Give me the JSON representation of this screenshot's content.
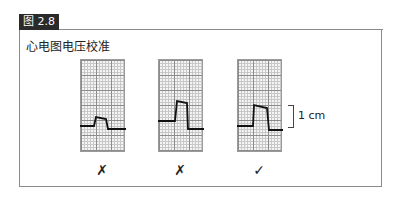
{
  "figure": {
    "label": "图 2.8",
    "title": "心电图电压校准"
  },
  "panels": [
    {
      "id": "panel-1",
      "pulse_height": "under",
      "mark": "✗",
      "mark_meaning": "incorrect"
    },
    {
      "id": "panel-2",
      "pulse_height": "over",
      "mark": "✗",
      "mark_meaning": "incorrect"
    },
    {
      "id": "panel-3",
      "pulse_height": "1 cm",
      "mark": "✓",
      "mark_meaning": "correct"
    }
  ],
  "annotation": {
    "scale_label": "1 cm"
  }
}
